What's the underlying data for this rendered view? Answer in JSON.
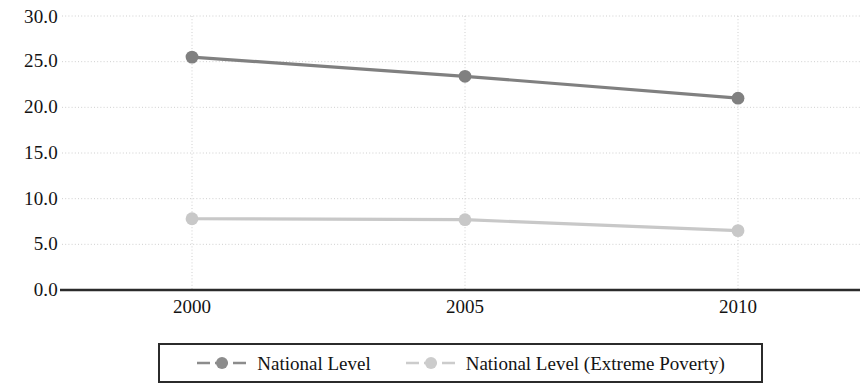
{
  "chart_data": {
    "type": "line",
    "title": "",
    "subtitle": "",
    "xlabel": "",
    "ylabel": "",
    "categories": [
      "2000",
      "2005",
      "2010"
    ],
    "x": [
      2000,
      2005,
      2010
    ],
    "xlim": [
      2000,
      2010
    ],
    "ylim": [
      0.0,
      30.0
    ],
    "y_ticks": [
      "0.0",
      "5.0",
      "10.0",
      "15.0",
      "20.0",
      "25.0",
      "30.0"
    ],
    "y_tick_values": [
      0.0,
      5.0,
      10.0,
      15.0,
      20.0,
      25.0,
      30.0
    ],
    "x_ticks": [
      "2000",
      "2005",
      "2010"
    ],
    "grid": "horizontal-and-vertical-dotted",
    "legend_position": "bottom-center",
    "series": [
      {
        "name": "National Level",
        "values": [
          25.5,
          23.4,
          21.0
        ],
        "color": "#808080",
        "marker": "circle"
      },
      {
        "name": "National Level (Extreme Poverty)",
        "values": [
          7.8,
          7.7,
          6.5
        ],
        "color": "#c8c8c8",
        "marker": "circle"
      }
    ]
  },
  "axes": {
    "y_labels": [
      "30.0",
      "25.0",
      "20.0",
      "15.0",
      "10.0",
      "5.0",
      "0.0"
    ],
    "x_labels": [
      "2000",
      "2005",
      "2010"
    ]
  },
  "legend": {
    "entries": [
      {
        "label": "National Level",
        "color": "#808080"
      },
      {
        "label": "National Level (Extreme Poverty)",
        "color": "#c8c8c8"
      }
    ]
  },
  "colors": {
    "series_primary": "#808080",
    "series_secondary": "#c8c8c8",
    "axis_line": "#2b2b2b",
    "gridline": "#cfcfcf",
    "text": "#131313",
    "background": "#ffffff"
  }
}
